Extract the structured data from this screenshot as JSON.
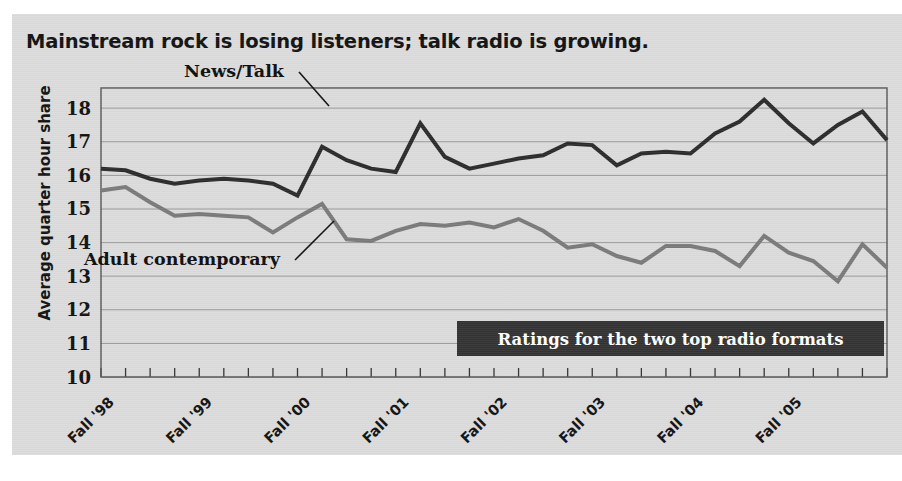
{
  "figure": {
    "title": "Mainstream rock is losing listeners; talk radio is growing.",
    "panel_background": "#dcdcdc",
    "page_background": "#ffffff"
  },
  "callout": {
    "text": "Ratings for the two top radio formats",
    "background": "#333333",
    "text_color": "#ffffff"
  },
  "annotations": {
    "news_talk_label": "News/Talk",
    "adult_contemporary_label": "Adult contemporary"
  },
  "chart_data": {
    "type": "line",
    "title": "Mainstream rock is losing listeners; talk radio is growing.",
    "subtitle": "Ratings for the two top radio formats",
    "xlabel": "",
    "ylabel": "Average quarter hour share",
    "ylim": [
      10,
      18.6
    ],
    "yticks": [
      10,
      11,
      12,
      13,
      14,
      15,
      16,
      17,
      18
    ],
    "grid": true,
    "legend": "inline-labels",
    "x_tick_labels": [
      "Fall '98",
      "Fall '99",
      "Fall '00",
      "Fall '01",
      "Fall '02",
      "Fall '03",
      "Fall '04",
      "Fall '05"
    ],
    "x_tick_label_indices": [
      0,
      4,
      8,
      12,
      16,
      20,
      24,
      28
    ],
    "x_tick_label_rotation": -45,
    "x_point_count": 30,
    "series": [
      {
        "name": "News/Talk",
        "color": "#2b2b2b",
        "line_width": 4,
        "values": [
          16.2,
          16.15,
          15.9,
          15.75,
          15.85,
          15.9,
          15.85,
          15.75,
          15.4,
          16.85,
          16.45,
          16.2,
          16.1,
          17.55,
          16.55,
          16.2,
          16.35,
          16.5,
          16.6,
          16.95,
          16.9,
          16.3,
          16.65,
          16.7,
          16.65,
          17.25,
          17.6,
          18.25,
          17.55,
          16.95,
          17.5,
          17.9,
          17.05
        ]
      },
      {
        "name": "Adult contemporary",
        "color": "#7a7a7a",
        "line_width": 4,
        "values": [
          15.55,
          15.65,
          15.2,
          14.8,
          14.85,
          14.8,
          14.75,
          14.3,
          14.75,
          15.15,
          14.1,
          14.05,
          14.35,
          14.55,
          14.5,
          14.6,
          14.45,
          14.7,
          14.35,
          13.85,
          13.95,
          13.6,
          13.4,
          13.9,
          13.9,
          13.75,
          13.3,
          14.2,
          13.7,
          13.45,
          12.85,
          13.95,
          13.25
        ]
      }
    ]
  }
}
